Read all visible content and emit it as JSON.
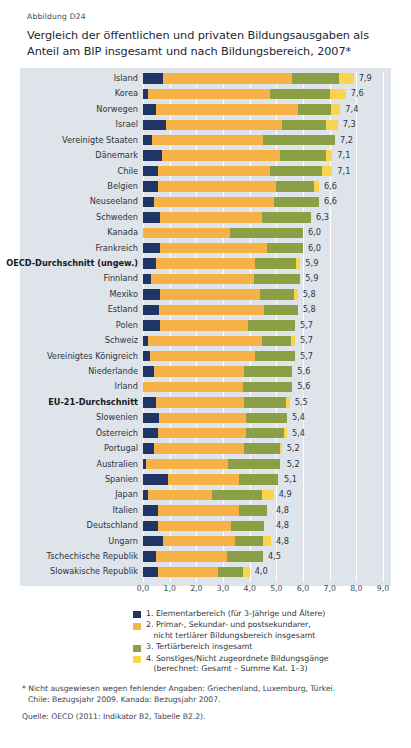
{
  "header": {
    "figure_number": "Abbildung D24",
    "title": "Vergleich der öffentlichen und privaten Bildungsausgaben als Anteil am BIP insgesamt und nach Bildungsbereich, 2007*"
  },
  "colors": {
    "elementary": "#1f3566",
    "primary_secondary": "#f7b247",
    "tertiary": "#8ba044",
    "other": "#f8d44f",
    "panel_background": "#dfe3ea",
    "gridline": "#ffffff"
  },
  "legend": {
    "items": [
      {
        "n": "1.",
        "swatch": "elementary",
        "line1": "1. Elementarbereich (für 3-Jährige und Ältere)",
        "line2": ""
      },
      {
        "n": "2.",
        "swatch": "primary_secondary",
        "line1": "2. Primar-, Sekundar- und postsekundarer,",
        "line2": "nicht tertiärer Bildungsbereich insgesamt"
      },
      {
        "n": "3.",
        "swatch": "tertiary",
        "line1": "3. Tertiärbereich insgesamt",
        "line2": ""
      },
      {
        "n": "4.",
        "swatch": "other",
        "line1": "4. Sonstiges/Nicht zugeordnete Bildungsgänge",
        "line2": "(berechnet: Gesamt – Summe Kat. 1–3)"
      }
    ]
  },
  "footnotes": {
    "note_line1": "* Nicht ausgewiesen wegen fehlender Angaben: Griechenland, Luxemburg, Türkei.",
    "note_line2": "Chile: Bezugsjahr 2009. Kanada: Bezugsjahr 2007.",
    "source": "Quelle: OECD (2011: Indikator B2, Tabelle B2.2)."
  },
  "chart_data": {
    "type": "bar",
    "orientation": "horizontal",
    "stacked": true,
    "title": "Vergleich der öffentlichen und privaten Bildungsausgaben als Anteil am BIP insgesamt und nach Bildungsbereich, 2007*",
    "xlabel": "",
    "ylabel": "",
    "xlim": [
      0,
      9
    ],
    "xticks": [
      "0,0",
      "1,0",
      "2,0",
      "3,0",
      "4,0",
      "5,0",
      "6,0",
      "7,0",
      "8,0",
      "9,0"
    ],
    "xtick_values": [
      0,
      1,
      2,
      3,
      4,
      5,
      6,
      7,
      8,
      9
    ],
    "grid": true,
    "legend_position": "bottom",
    "series": [
      {
        "name": "1. Elementarbereich (für 3-Jährige und Ältere)",
        "key": "elementary",
        "color": "#1f3566"
      },
      {
        "name": "2. Primar-, Sekundar- und postsekundarer, nicht tertiärer Bildungsbereich insgesamt",
        "key": "primary_secondary",
        "color": "#f7b247"
      },
      {
        "name": "3. Tertiärbereich insgesamt",
        "key": "tertiary",
        "color": "#8ba044"
      },
      {
        "name": "4. Sonstiges/Nicht zugeordnete Bildungsgänge (berechnet: Gesamt – Summe Kat. 1–3)",
        "key": "other",
        "color": "#f8d44f"
      }
    ],
    "categories": [
      "Island",
      "Korea",
      "Norwegen",
      "Israel",
      "Vereinigte Staaten",
      "Dänemark",
      "Chile",
      "Belgien",
      "Neuseeland",
      "Schweden",
      "Kanada",
      "Frankreich",
      "OECD-Durchschnitt (ungew.)",
      "Finnland",
      "Mexiko",
      "Estland",
      "Polen",
      "Schweiz",
      "Vereinigtes Königreich",
      "Niederlande",
      "Irland",
      "EU-21-Durchschnitt",
      "Slowenien",
      "Österreich",
      "Portugal",
      "Australien",
      "Spanien",
      "Japan",
      "Italien",
      "Deutschland",
      "Ungarn",
      "Tschechische Republik",
      "Slowakische Republik"
    ],
    "rows": [
      {
        "label": "Island",
        "total": "7,9",
        "total_value": 7.9,
        "bold": false,
        "segments": [
          0.75,
          4.85,
          1.75,
          0.55
        ]
      },
      {
        "label": "Korea",
        "total": "7,6",
        "total_value": 7.6,
        "bold": false,
        "segments": [
          0.2,
          4.55,
          2.25,
          0.6
        ]
      },
      {
        "label": "Norwegen",
        "total": "7,4",
        "total_value": 7.4,
        "bold": false,
        "segments": [
          0.5,
          5.3,
          1.25,
          0.35
        ]
      },
      {
        "label": "Israel",
        "total": "7,3",
        "total_value": 7.3,
        "bold": false,
        "segments": [
          0.85,
          4.35,
          1.65,
          0.45
        ]
      },
      {
        "label": "Vereinigte Staaten",
        "total": "7,2",
        "total_value": 7.2,
        "bold": false,
        "segments": [
          0.35,
          4.15,
          2.7,
          0.0
        ]
      },
      {
        "label": "Dänemark",
        "total": "7,1",
        "total_value": 7.1,
        "bold": false,
        "segments": [
          0.7,
          4.45,
          1.7,
          0.25
        ]
      },
      {
        "label": "Chile",
        "total": "7,1",
        "total_value": 7.1,
        "bold": false,
        "segments": [
          0.55,
          4.2,
          1.95,
          0.4
        ]
      },
      {
        "label": "Belgien",
        "total": "6,6",
        "total_value": 6.6,
        "bold": false,
        "segments": [
          0.55,
          4.45,
          1.4,
          0.2
        ]
      },
      {
        "label": "Neuseeland",
        "total": "6,6",
        "total_value": 6.6,
        "bold": false,
        "segments": [
          0.4,
          4.5,
          1.7,
          0.0
        ]
      },
      {
        "label": "Schweden",
        "total": "6,3",
        "total_value": 6.3,
        "bold": false,
        "segments": [
          0.65,
          3.8,
          1.85,
          0.0
        ]
      },
      {
        "label": "Kanada",
        "total": "6,0",
        "total_value": 6.0,
        "bold": false,
        "segments": [
          0.0,
          3.25,
          2.75,
          0.0
        ]
      },
      {
        "label": "Frankreich",
        "total": "6,0",
        "total_value": 6.0,
        "bold": false,
        "segments": [
          0.65,
          4.0,
          1.35,
          0.0
        ]
      },
      {
        "label": "OECD-Durchschnitt (ungew.)",
        "total": "5,9",
        "total_value": 5.9,
        "bold": true,
        "segments": [
          0.5,
          3.7,
          1.55,
          0.15
        ]
      },
      {
        "label": "Finnland",
        "total": "5,9",
        "total_value": 5.9,
        "bold": false,
        "segments": [
          0.3,
          3.85,
          1.75,
          0.0
        ]
      },
      {
        "label": "Mexiko",
        "total": "5,8",
        "total_value": 5.8,
        "bold": false,
        "segments": [
          0.65,
          3.75,
          1.25,
          0.15
        ]
      },
      {
        "label": "Estland",
        "total": "5,8",
        "total_value": 5.8,
        "bold": false,
        "segments": [
          0.6,
          3.95,
          1.25,
          0.0
        ]
      },
      {
        "label": "Polen",
        "total": "5,7",
        "total_value": 5.7,
        "bold": false,
        "segments": [
          0.65,
          3.3,
          1.75,
          0.0
        ]
      },
      {
        "label": "Schweiz",
        "total": "5,7",
        "total_value": 5.7,
        "bold": false,
        "segments": [
          0.2,
          4.25,
          1.1,
          0.15
        ]
      },
      {
        "label": "Vereinigtes Königreich",
        "total": "5,7",
        "total_value": 5.7,
        "bold": false,
        "segments": [
          0.25,
          3.95,
          1.5,
          0.0
        ]
      },
      {
        "label": "Niederlande",
        "total": "5,6",
        "total_value": 5.6,
        "bold": false,
        "segments": [
          0.4,
          3.4,
          1.8,
          0.0
        ]
      },
      {
        "label": "Irland",
        "total": "5,6",
        "total_value": 5.6,
        "bold": false,
        "segments": [
          0.0,
          3.75,
          1.85,
          0.0
        ]
      },
      {
        "label": "EU-21-Durchschnitt",
        "total": "5,5",
        "total_value": 5.5,
        "bold": true,
        "segments": [
          0.5,
          3.3,
          1.55,
          0.15
        ]
      },
      {
        "label": "Slowenien",
        "total": "5,4",
        "total_value": 5.4,
        "bold": false,
        "segments": [
          0.6,
          3.25,
          1.55,
          0.0
        ]
      },
      {
        "label": "Österreich",
        "total": "5,4",
        "total_value": 5.4,
        "bold": false,
        "segments": [
          0.55,
          3.3,
          1.45,
          0.1
        ]
      },
      {
        "label": "Portugal",
        "total": "5,2",
        "total_value": 5.2,
        "bold": false,
        "segments": [
          0.4,
          3.4,
          1.35,
          0.05
        ]
      },
      {
        "label": "Australien",
        "total": "5,2",
        "total_value": 5.2,
        "bold": false,
        "segments": [
          0.1,
          3.1,
          1.95,
          0.0
        ]
      },
      {
        "label": "Spanien",
        "total": "5,1",
        "total_value": 5.1,
        "bold": false,
        "segments": [
          0.95,
          2.65,
          1.45,
          0.0
        ]
      },
      {
        "label": "Japan",
        "total": "4,9",
        "total_value": 4.9,
        "bold": false,
        "segments": [
          0.2,
          2.4,
          1.85,
          0.45
        ]
      },
      {
        "label": "Italien",
        "total": "4,8",
        "total_value": 4.8,
        "bold": false,
        "segments": [
          0.55,
          3.05,
          1.05,
          0.0
        ]
      },
      {
        "label": "Deutschland",
        "total": "4,8",
        "total_value": 4.8,
        "bold": false,
        "segments": [
          0.55,
          2.75,
          1.25,
          0.0
        ]
      },
      {
        "label": "Ungarn",
        "total": "4,8",
        "total_value": 4.8,
        "bold": false,
        "segments": [
          0.75,
          2.7,
          1.05,
          0.3
        ]
      },
      {
        "label": "Tschechische Republik",
        "total": "4,5",
        "total_value": 4.5,
        "bold": false,
        "segments": [
          0.5,
          2.65,
          1.35,
          0.0
        ]
      },
      {
        "label": "Slowakische Republik",
        "total": "4,0",
        "total_value": 4.0,
        "bold": false,
        "segments": [
          0.55,
          2.25,
          0.95,
          0.25
        ]
      }
    ]
  }
}
